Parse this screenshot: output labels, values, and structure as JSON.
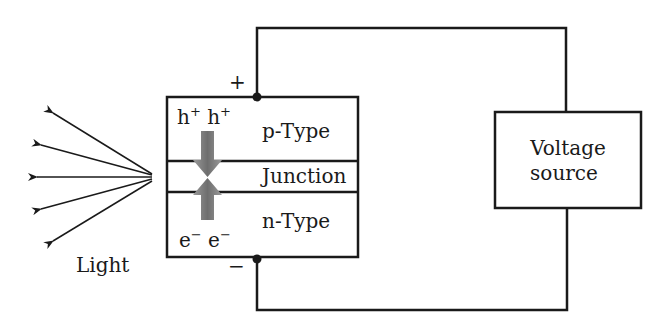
{
  "diagram": {
    "labels": {
      "plus": "+",
      "minus": "−",
      "p_type": "p-Type",
      "junction": "Junction",
      "n_type": "n-Type",
      "holes": "h⁺ h⁺",
      "electrons": "e⁻ e⁻",
      "light": "Light",
      "voltage_line1": "Voltage",
      "voltage_line2": "source"
    },
    "colors": {
      "line": "#1a1a1a",
      "arrow_fill": "#7a7a7a",
      "background": "#ffffff"
    },
    "light_rays": 5
  }
}
